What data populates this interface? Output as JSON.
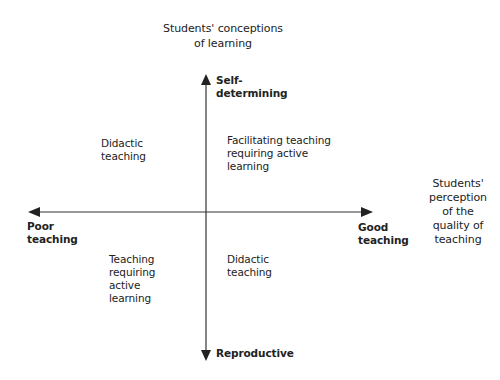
{
  "diagram": {
    "type": "quadrant-diagram",
    "vertical_axis": {
      "title": [
        "Students' conceptions",
        "of learning"
      ],
      "top_label": [
        "Self-",
        "determining"
      ],
      "bottom_label": "Reproductive"
    },
    "horizontal_axis": {
      "title": [
        "Students'",
        "perception",
        "of the",
        "quality of",
        "teaching"
      ],
      "left_label": [
        "Poor",
        "teaching"
      ],
      "right_label": [
        "Good",
        "teaching"
      ]
    },
    "quadrants": {
      "top_left": [
        "Didactic",
        "teaching"
      ],
      "top_right": [
        "Facilitating teaching",
        "requiring active",
        "learning"
      ],
      "bottom_left": [
        "Teaching",
        "requiring",
        "active",
        "learning"
      ],
      "bottom_right": [
        "Didactic",
        "teaching"
      ]
    },
    "colors": {
      "axis": "#333333",
      "text": "#222222",
      "background": "#ffffff"
    }
  }
}
